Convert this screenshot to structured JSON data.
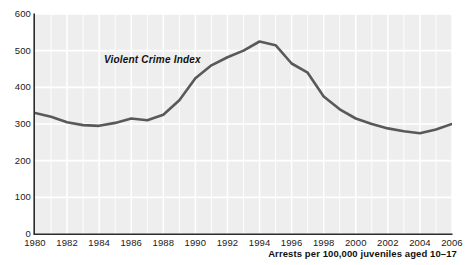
{
  "chart_data": {
    "type": "line",
    "title": "",
    "subtitle": "",
    "xlabel": "Arrests per 100,000 juveniles aged 10–17",
    "ylabel": "",
    "xlim": [
      1980,
      2006
    ],
    "ylim": [
      0,
      600
    ],
    "grid": true,
    "legend_position": "inline-annotation",
    "annotations": [
      "Violent Crime Index"
    ],
    "x": [
      1980,
      1981,
      1982,
      1983,
      1984,
      1985,
      1986,
      1987,
      1988,
      1989,
      1990,
      1991,
      1992,
      1993,
      1994,
      1995,
      1996,
      1997,
      1998,
      1999,
      2000,
      2001,
      2002,
      2003,
      2004,
      2005,
      2006
    ],
    "series": [
      {
        "name": "Violent Crime Index",
        "color": "#595959",
        "values": [
          330,
          320,
          305,
          297,
          295,
          303,
          315,
          310,
          325,
          365,
          425,
          460,
          482,
          500,
          525,
          515,
          465,
          440,
          375,
          340,
          315,
          300,
          288,
          280,
          275,
          285,
          300
        ]
      }
    ],
    "x_ticks": [
      1980,
      1982,
      1984,
      1986,
      1988,
      1990,
      1992,
      1994,
      1996,
      1998,
      2000,
      2002,
      2004,
      2006
    ],
    "x_tick_labels": [
      "1980",
      "1982",
      "1984",
      "1986",
      "1988",
      "1990",
      "1992",
      "1994",
      "1996",
      "1998",
      "2000",
      "2002",
      "2004",
      "2006"
    ],
    "y_ticks": [
      0,
      100,
      200,
      300,
      400,
      500,
      600
    ],
    "y_tick_labels": [
      "0",
      "100",
      "200",
      "300",
      "400",
      "500",
      "600"
    ],
    "plot_background": "#eeeeee",
    "gridline_color": "#ffffff",
    "axis_color": "#2b2b2b"
  },
  "chart": {
    "series_label": "Violent Crime Index",
    "x_axis_title": "Arrests per 100,000 juveniles aged 10–17",
    "source_note": ""
  }
}
